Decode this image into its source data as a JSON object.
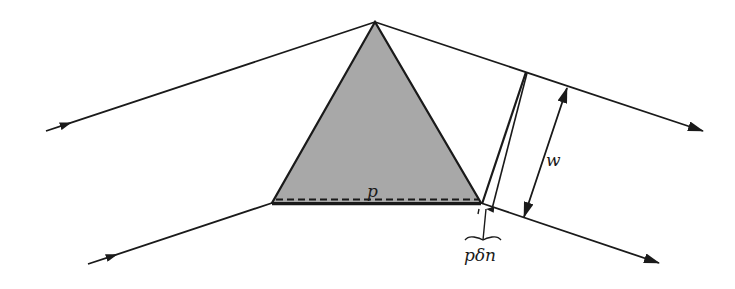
{
  "figure": {
    "type": "prism-dispersion-diagram",
    "prism": {
      "fill": "#a8a8a8",
      "stroke": "#1a1a1a",
      "apex": [
        375,
        22
      ],
      "base_left": [
        272,
        203
      ],
      "base_right": [
        481,
        203
      ]
    },
    "labels": {
      "base_length": "p",
      "beam_width": "w",
      "path_difference": "pδn"
    },
    "rays": [
      {
        "name": "incident-upper",
        "from": [
          46,
          131
        ],
        "to": [
          375,
          22
        ],
        "arrow": "incoming"
      },
      {
        "name": "incident-lower",
        "from": [
          88,
          264
        ],
        "to": [
          272,
          203
        ],
        "arrow": "incoming"
      },
      {
        "name": "emergent-upper",
        "from": [
          375,
          22
        ],
        "to": [
          703,
          131
        ],
        "arrow": "outgoing"
      },
      {
        "name": "emergent-lower",
        "from": [
          481,
          203
        ],
        "to": [
          659,
          263
        ],
        "arrow": "outgoing"
      }
    ],
    "colors": {
      "line": "#1a1a1a",
      "prism_fill": "#a8a8a8",
      "background": "#ffffff"
    }
  }
}
